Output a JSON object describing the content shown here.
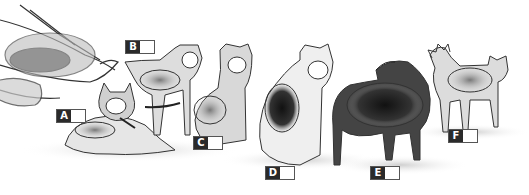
{
  "image": {
    "description": "Pencil sketch illustration of a dog sled and six sled dogs, each marked with a lettered answer box",
    "labels": [
      {
        "letter": "A",
        "x": 56,
        "y": 109
      },
      {
        "letter": "B",
        "x": 125,
        "y": 40
      },
      {
        "letter": "C",
        "x": 193,
        "y": 136
      },
      {
        "letter": "D",
        "x": 265,
        "y": 166
      },
      {
        "letter": "E",
        "x": 370,
        "y": 166
      },
      {
        "letter": "F",
        "x": 448,
        "y": 129
      }
    ]
  }
}
